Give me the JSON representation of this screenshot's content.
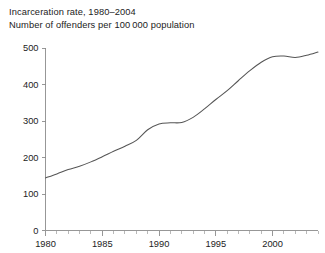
{
  "figure": {
    "title_line1": "Incarceration rate, 1980–2004",
    "title_line2": "Number of offenders per 100 000 population",
    "background_color": "#ffffff",
    "line_color": "#555555",
    "axis_color": "#8c8c8c",
    "text_color": "#222222"
  },
  "chart_data": {
    "type": "line",
    "title": "Incarceration rate, 1980–2004",
    "subtitle": "Number of offenders per 100 000 population",
    "xlabel": "",
    "ylabel": "",
    "xlim": [
      1980,
      2004
    ],
    "ylim": [
      0,
      500
    ],
    "grid": false,
    "legend": false,
    "legend_position": "none",
    "x_ticks_major": [
      1980,
      1985,
      1990,
      1995,
      2000
    ],
    "x_tick_labels": [
      "1980",
      "1985",
      "1990",
      "1995",
      "2000"
    ],
    "x_ticks_minor": [
      1981,
      1982,
      1983,
      1984,
      1986,
      1987,
      1988,
      1989,
      1991,
      1992,
      1993,
      1994,
      1996,
      1997,
      1998,
      1999,
      2001,
      2002,
      2003,
      2004
    ],
    "y_ticks": [
      0,
      100,
      200,
      300,
      400,
      500
    ],
    "y_tick_labels": [
      "0",
      "100",
      "200",
      "300",
      "400",
      "500"
    ],
    "series": [
      {
        "name": "Incarceration rate",
        "color": "#555555",
        "x": [
          1980,
          1981,
          1982,
          1983,
          1984,
          1985,
          1986,
          1987,
          1988,
          1989,
          1990,
          1991,
          1992,
          1993,
          1994,
          1995,
          1996,
          1997,
          1998,
          1999,
          2000,
          2001,
          2002,
          2003,
          2004
        ],
        "values": [
          144,
          155,
          167,
          176,
          188,
          202,
          217,
          231,
          247,
          276,
          292,
          295,
          296,
          310,
          333,
          359,
          383,
          411,
          438,
          461,
          476,
          478,
          474,
          480,
          489
        ]
      }
    ]
  }
}
